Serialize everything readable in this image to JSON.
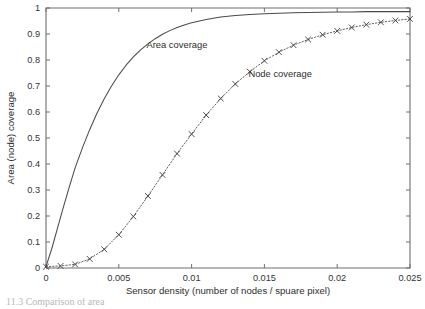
{
  "chart_data": {
    "type": "line",
    "title": "",
    "xlabel": "Sensor density (number of nodes / spuare pixel)",
    "ylabel": "Area (node) coverage",
    "xlim": [
      0,
      0.025
    ],
    "ylim": [
      0,
      1
    ],
    "grid": false,
    "legend": "inline-annotations",
    "xticks": [
      0,
      0.005,
      0.01,
      0.015,
      0.02,
      0.025
    ],
    "xtick_labels": [
      "0",
      "0.005",
      "0.01",
      "0.015",
      "0.02",
      "0.025"
    ],
    "yticks": [
      0,
      0.1,
      0.2,
      0.3,
      0.4,
      0.5,
      0.6,
      0.7,
      0.8,
      0.9,
      1
    ],
    "ytick_labels": [
      "0",
      "0.1",
      "0.2",
      "0.3",
      "0.4",
      "0.5",
      "0.6",
      "0.7",
      "0.8",
      "0.9",
      "1"
    ],
    "annotations": [
      {
        "text": "Area coverage",
        "x": 0.0069,
        "y": 0.845
      },
      {
        "text": "Node coverage",
        "x": 0.0139,
        "y": 0.735
      }
    ],
    "series": [
      {
        "name": "Area coverage",
        "style": "solid",
        "marker": "none",
        "color": "#4a4a4a",
        "x": [
          0,
          0.0004,
          0.0008,
          0.0012,
          0.0016,
          0.002,
          0.0025,
          0.003,
          0.0035,
          0.004,
          0.0045,
          0.005,
          0.0055,
          0.006,
          0.0065,
          0.007,
          0.0075,
          0.008,
          0.0085,
          0.009,
          0.0095,
          0.01,
          0.011,
          0.012,
          0.013,
          0.014,
          0.015,
          0.016,
          0.017,
          0.018,
          0.019,
          0.02,
          0.021,
          0.022,
          0.023,
          0.024,
          0.025
        ],
        "y": [
          0.005,
          0.075,
          0.155,
          0.235,
          0.312,
          0.385,
          0.462,
          0.532,
          0.595,
          0.651,
          0.7,
          0.743,
          0.78,
          0.812,
          0.839,
          0.862,
          0.882,
          0.899,
          0.913,
          0.925,
          0.935,
          0.943,
          0.956,
          0.965,
          0.971,
          0.975,
          0.978,
          0.98,
          0.982,
          0.983,
          0.984,
          0.985,
          0.985,
          0.986,
          0.986,
          0.986,
          0.986
        ]
      },
      {
        "name": "Node coverage",
        "style": "dotted",
        "marker": "x",
        "color": "#5a5a5a",
        "x": [
          0,
          0.001,
          0.002,
          0.003,
          0.004,
          0.005,
          0.006,
          0.007,
          0.008,
          0.009,
          0.01,
          0.011,
          0.012,
          0.013,
          0.014,
          0.015,
          0.016,
          0.017,
          0.018,
          0.019,
          0.02,
          0.021,
          0.022,
          0.023,
          0.024,
          0.025
        ],
        "y": [
          0.005,
          0.008,
          0.014,
          0.035,
          0.072,
          0.128,
          0.198,
          0.277,
          0.358,
          0.44,
          0.515,
          0.588,
          0.652,
          0.708,
          0.755,
          0.797,
          0.83,
          0.857,
          0.879,
          0.897,
          0.912,
          0.925,
          0.936,
          0.945,
          0.952,
          0.958
        ]
      }
    ]
  },
  "caption": {
    "partial_text": "11.3  Comparison of area"
  }
}
